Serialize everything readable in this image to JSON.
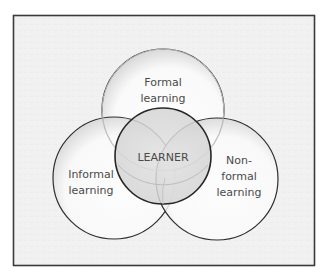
{
  "diagram": {
    "type": "venn",
    "colors": {
      "frame_border": "#3a3a3a",
      "frame_fill": "#f1f1f1",
      "circle_fill": "#fbfbfb",
      "circle_stroke": "#2e2e2e",
      "center_fill": "#d9d9d9",
      "text": "#4a4a4a"
    },
    "circles": {
      "top": {
        "label_line1": "Formal",
        "label_line2": "learning"
      },
      "left": {
        "label_line1": "Informal",
        "label_line2": "learning"
      },
      "right": {
        "label_line1": "Non-",
        "label_line2": "formal",
        "label_line3": "learning"
      },
      "center": {
        "label": "LEARNER"
      }
    }
  }
}
